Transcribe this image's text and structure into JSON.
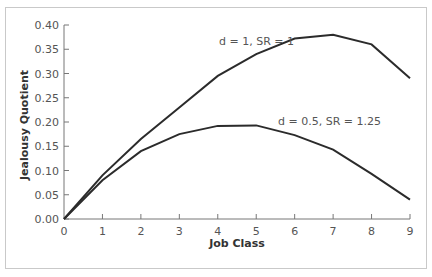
{
  "chart_data": {
    "type": "line",
    "title": "",
    "xlabel": "Job Class",
    "ylabel": "Jealousy Quotient",
    "x": [
      0,
      1,
      2,
      3,
      4,
      5,
      6,
      7,
      8,
      9
    ],
    "xlim": [
      0,
      9
    ],
    "ylim": [
      0,
      0.4
    ],
    "x_ticks": [
      "0",
      "1",
      "2",
      "3",
      "4",
      "5",
      "6",
      "7",
      "8",
      "9"
    ],
    "y_ticks": [
      "0.00",
      "0.05",
      "0.10",
      "0.15",
      "0.20",
      "0.25",
      "0.30",
      "0.35",
      "0.40"
    ],
    "grid": false,
    "legend": "none (inline annotations)",
    "series": [
      {
        "name": "d = 1, SR = 1",
        "values": [
          0.0,
          0.09,
          0.165,
          0.23,
          0.295,
          0.34,
          0.372,
          0.38,
          0.36,
          0.29
        ],
        "color": "#2b2b2b"
      },
      {
        "name": "d = 0.5, SR = 1.25",
        "values": [
          0.0,
          0.08,
          0.14,
          0.175,
          0.192,
          0.193,
          0.173,
          0.143,
          0.093,
          0.04
        ],
        "color": "#2b2b2b"
      }
    ],
    "annotations": [
      {
        "text": "d = 1, SR = 1",
        "series": 0
      },
      {
        "text": "d = 0.5, SR = 1.25",
        "series": 1
      }
    ]
  },
  "labels": {
    "xlabel": "Job Class",
    "ylabel": "Jealousy Quotient",
    "annot_upper": "d = 1, SR = 1",
    "annot_lower": "d = 0.5, SR = 1.25"
  }
}
